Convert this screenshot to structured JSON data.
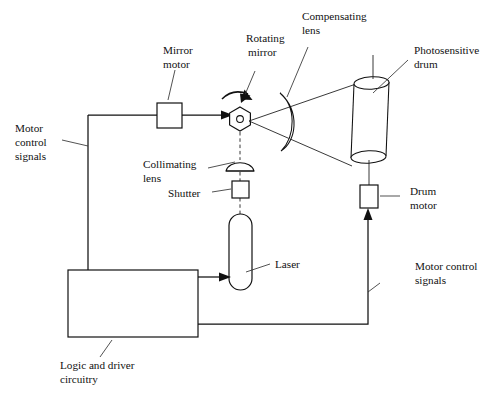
{
  "diagram": {
    "background_color": "#ffffff",
    "line_color": "#111111",
    "labels": {
      "mirror_motor": {
        "line1": "Mirror",
        "line2": "motor"
      },
      "rotating_mirror": {
        "line1": "Rotating",
        "line2": "mirror"
      },
      "compensating_lens": {
        "line1": "Compensating",
        "line2": "lens"
      },
      "photosensitive_drum": {
        "line1": "Photosensitive",
        "line2": "drum"
      },
      "motor_control_signals_left": {
        "line1": "Motor",
        "line2": "control",
        "line3": "signals"
      },
      "motor_control_signals_right": {
        "line1": "Motor control",
        "line2": "signals"
      },
      "collimating_lens": {
        "line1": "Collimating",
        "line2": "lens"
      },
      "shutter": {
        "line1": "Shutter"
      },
      "laser": {
        "line1": "Laser"
      },
      "drum_motor": {
        "line1": "Drum",
        "line2": "motor"
      },
      "logic_and_driver_circuitry": {
        "line1": "Logic  and  driver",
        "line2": "circuitry"
      }
    },
    "components": [
      {
        "name": "mirror-motor",
        "shape": "square"
      },
      {
        "name": "rotating-mirror",
        "shape": "hexagon"
      },
      {
        "name": "compensating-lens",
        "shape": "meniscus"
      },
      {
        "name": "photosensitive-drum",
        "shape": "cylinder"
      },
      {
        "name": "drum-motor",
        "shape": "rectangle"
      },
      {
        "name": "collimating-lens",
        "shape": "plano-convex"
      },
      {
        "name": "shutter",
        "shape": "square"
      },
      {
        "name": "laser",
        "shape": "stadium"
      },
      {
        "name": "logic-and-driver-circuitry",
        "shape": "rectangle"
      }
    ]
  }
}
